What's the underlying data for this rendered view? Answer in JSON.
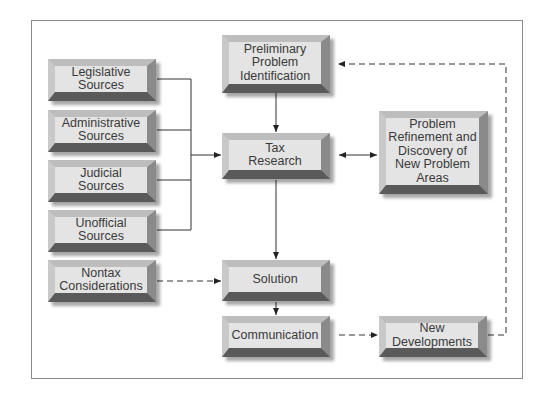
{
  "diagram": {
    "nodes": {
      "legislative": {
        "label": "Legislative Sources"
      },
      "administrative": {
        "label": "Administrative Sources"
      },
      "judicial": {
        "label": "Judicial Sources"
      },
      "unofficial": {
        "label": "Unofficial Sources"
      },
      "nontax": {
        "label": "Nontax Considerations"
      },
      "preliminary": {
        "label": "Preliminary Problem Identification"
      },
      "tax_research": {
        "label": "Tax Research"
      },
      "refinement": {
        "label": "Problem Refinement and Discovery of New Problem Areas"
      },
      "solution": {
        "label": "Solution"
      },
      "communication": {
        "label": "Communication"
      },
      "new_developments": {
        "label": "New Developments"
      }
    },
    "edges": [
      {
        "from": "legislative",
        "to": "tax_research",
        "style": "solid"
      },
      {
        "from": "administrative",
        "to": "tax_research",
        "style": "solid"
      },
      {
        "from": "judicial",
        "to": "tax_research",
        "style": "solid"
      },
      {
        "from": "unofficial",
        "to": "tax_research",
        "style": "solid"
      },
      {
        "from": "preliminary",
        "to": "tax_research",
        "style": "solid"
      },
      {
        "from": "tax_research",
        "to": "refinement",
        "style": "solid",
        "bidirectional": true
      },
      {
        "from": "tax_research",
        "to": "solution",
        "style": "solid"
      },
      {
        "from": "nontax",
        "to": "solution",
        "style": "dashed"
      },
      {
        "from": "solution",
        "to": "communication",
        "style": "solid"
      },
      {
        "from": "communication",
        "to": "new_developments",
        "style": "dashed"
      },
      {
        "from": "new_developments",
        "to": "preliminary",
        "style": "dashed"
      }
    ]
  },
  "lines_text": {
    "legislative": [
      "Legislative",
      "Sources"
    ],
    "administrative": [
      "Administrative",
      "Sources"
    ],
    "judicial": [
      "Judicial",
      "Sources"
    ],
    "unofficial": [
      "Unofficial",
      "Sources"
    ],
    "nontax": [
      "Nontax",
      "Considerations"
    ],
    "preliminary": [
      "Preliminary",
      "Problem",
      "Identification"
    ],
    "tax_research": [
      "Tax",
      "Research"
    ],
    "refinement": [
      "Problem",
      "Refinement and",
      "Discovery of",
      "New Problem",
      "Areas"
    ],
    "solution": [
      "Solution"
    ],
    "communication": [
      "Communication"
    ],
    "new_developments": [
      "New",
      "Developments"
    ]
  }
}
